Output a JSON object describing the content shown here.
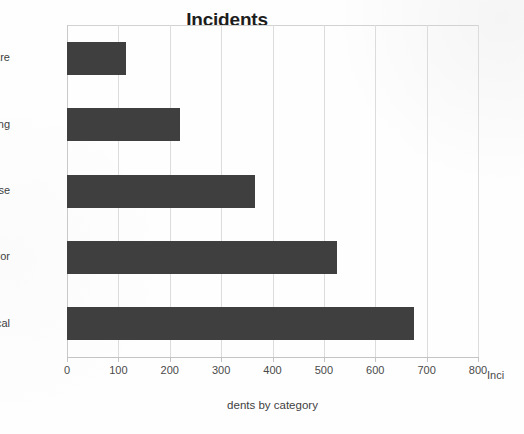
{
  "chart_data": {
    "type": "bar",
    "orientation": "horizontal",
    "title": "Incidents",
    "xlabel": "dents by category",
    "ylabel": "",
    "categories": [
      "malware",
      "hacking",
      "misuse",
      "error",
      "physical"
    ],
    "values": [
      115,
      220,
      365,
      525,
      675
    ],
    "xlim": [
      0,
      800
    ],
    "xticks": [
      0,
      100,
      200,
      300,
      400,
      500,
      600,
      700,
      800
    ],
    "xticklabels": [
      "0",
      "100",
      "200",
      "300",
      "400",
      "500",
      "600",
      "700",
      "800"
    ],
    "grid": "vertical",
    "legend": "none",
    "bar_color": "#3f3f3f",
    "gridline_color": "#dcdcdc",
    "annotations": [
      {
        "name": "clipped-axis-title-overflow",
        "text": "Inci",
        "note": "clipped remainder of the axis title rendered past the 800 tick"
      }
    ]
  }
}
